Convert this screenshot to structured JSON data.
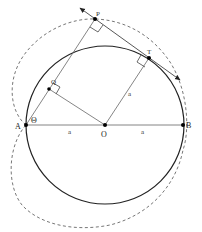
{
  "diagram": {
    "points": {
      "A": {
        "label": "A",
        "x": 26,
        "y": 125
      },
      "O": {
        "label": "O",
        "x": 105,
        "y": 125
      },
      "B": {
        "label": "B",
        "x": 183,
        "y": 125
      },
      "P": {
        "label": "P",
        "x": 95,
        "y": 19
      },
      "T": {
        "label": "T",
        "x": 149,
        "y": 58
      },
      "Q": {
        "label": "Q",
        "x": 49,
        "y": 89
      }
    },
    "angle_label": "Θ",
    "segment_labels": {
      "AO": "a",
      "OB": "a",
      "OT": "a"
    },
    "circle": {
      "cx": 105,
      "cy": 125,
      "r": 79
    },
    "colors": {
      "circle": "#222222",
      "lines": "#555555",
      "dashed_curve": "#777777",
      "points": "#000000"
    }
  }
}
